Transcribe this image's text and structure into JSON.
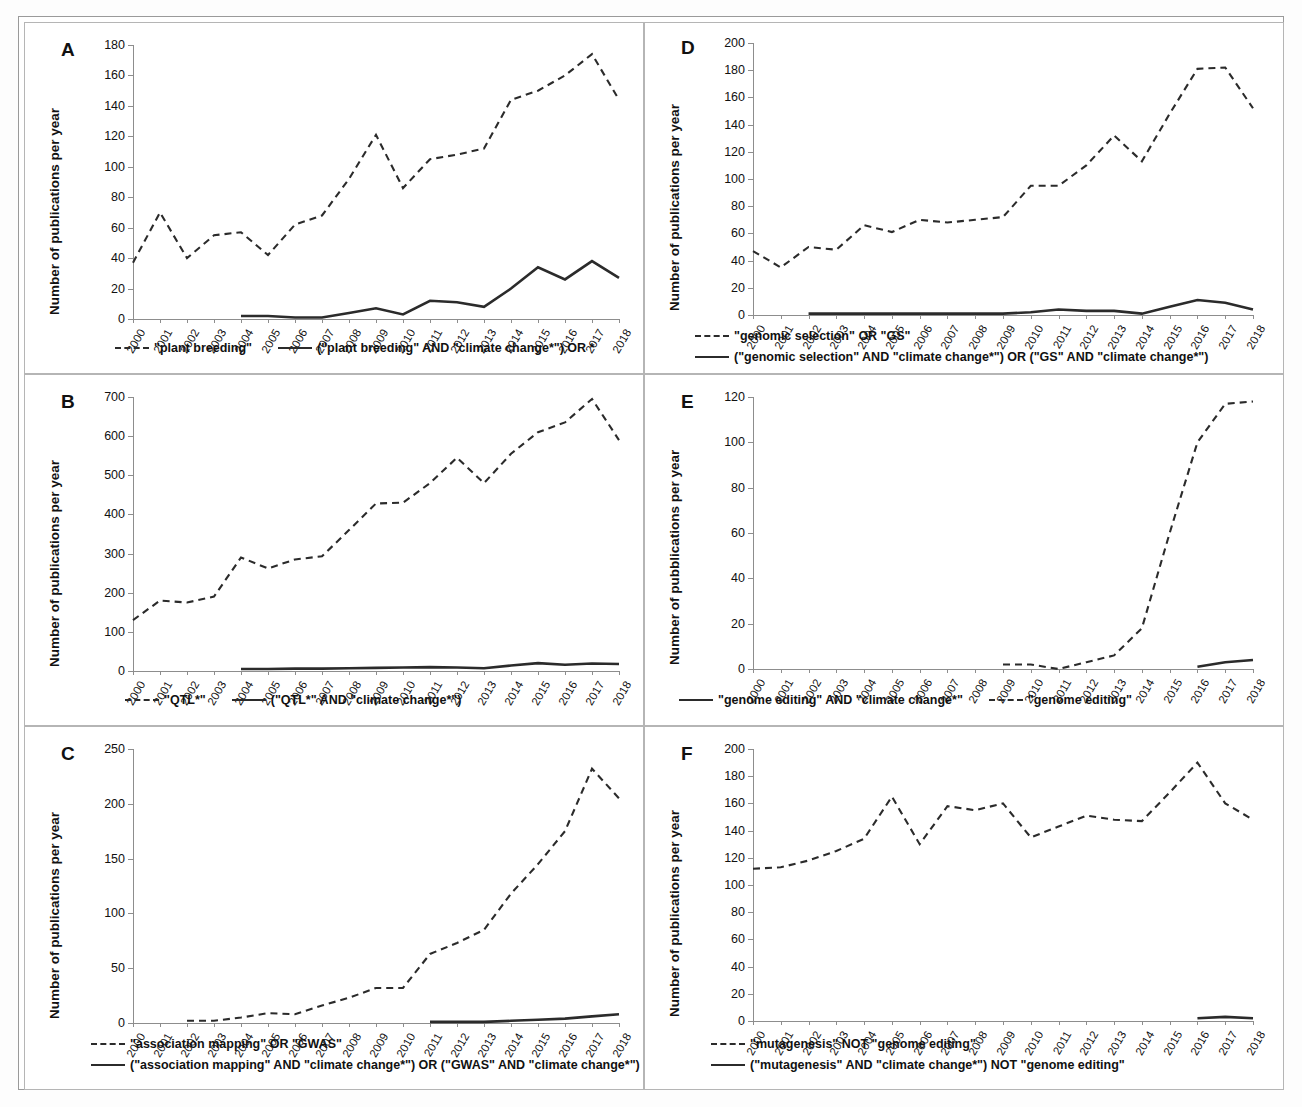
{
  "figure": {
    "ylabel_default": "Number of publications per year",
    "years": [
      2000,
      2001,
      2002,
      2003,
      2004,
      2005,
      2006,
      2007,
      2008,
      2009,
      2010,
      2011,
      2012,
      2013,
      2014,
      2015,
      2016,
      2017,
      2018
    ]
  },
  "panels": [
    {
      "letter": "A",
      "ylabel": "Number of publications per year",
      "chart_data": {
        "type": "line",
        "title": "A",
        "xlabel": "",
        "ylabel": "Number of publications per year",
        "ylim": [
          0,
          180
        ],
        "yticks": [
          0,
          20,
          40,
          60,
          80,
          100,
          120,
          140,
          160,
          180
        ],
        "grid": false,
        "legend_position": "bottom",
        "x": [
          2000,
          2001,
          2002,
          2003,
          2004,
          2005,
          2006,
          2007,
          2008,
          2009,
          2010,
          2011,
          2012,
          2013,
          2014,
          2015,
          2016,
          2017,
          2018
        ],
        "series": [
          {
            "name": "\"plant breeding\"",
            "style": "dashed",
            "x": [
              2000,
              2001,
              2002,
              2003,
              2004,
              2005,
              2006,
              2007,
              2008,
              2009,
              2010,
              2011,
              2012,
              2013,
              2014,
              2015,
              2016,
              2017,
              2018
            ],
            "values": [
              37,
              70,
              40,
              55,
              57,
              42,
              62,
              68,
              92,
              121,
              86,
              105,
              108,
              112,
              144,
              150,
              160,
              174,
              144
            ]
          },
          {
            "name": "(\"plant breeding\" AND \"climate change*\") OR *",
            "style": "solid",
            "x": [
              2004,
              2005,
              2006,
              2007,
              2008,
              2009,
              2010,
              2011,
              2012,
              2013,
              2014,
              2015,
              2016,
              2017,
              2018
            ],
            "values": [
              2,
              2,
              1,
              1,
              4,
              7,
              3,
              12,
              11,
              8,
              20,
              34,
              26,
              38,
              27
            ]
          }
        ]
      }
    },
    {
      "letter": "B",
      "ylabel": "Number of publications per year",
      "chart_data": {
        "type": "line",
        "title": "B",
        "xlabel": "",
        "ylabel": "Number of publications per year",
        "ylim": [
          0,
          700
        ],
        "yticks": [
          0,
          100,
          200,
          300,
          400,
          500,
          600,
          700
        ],
        "grid": false,
        "legend_position": "bottom",
        "x": [
          2000,
          2001,
          2002,
          2003,
          2004,
          2005,
          2006,
          2007,
          2008,
          2009,
          2010,
          2011,
          2012,
          2013,
          2014,
          2015,
          2016,
          2017,
          2018
        ],
        "series": [
          {
            "name": "\"QTL*\"",
            "style": "dashed",
            "x": [
              2000,
              2001,
              2002,
              2003,
              2004,
              2005,
              2006,
              2007,
              2008,
              2009,
              2010,
              2011,
              2012,
              2013,
              2014,
              2015,
              2016,
              2017,
              2018
            ],
            "values": [
              130,
              180,
              175,
              190,
              290,
              262,
              285,
              293,
              360,
              428,
              430,
              480,
              545,
              480,
              555,
              610,
              635,
              695,
              590
            ]
          },
          {
            "name": "(\"QTL*\" AND \"climate change*\")",
            "style": "solid",
            "x": [
              2004,
              2005,
              2006,
              2007,
              2008,
              2009,
              2010,
              2011,
              2012,
              2013,
              2014,
              2015,
              2016,
              2017,
              2018
            ],
            "values": [
              5,
              5,
              6,
              6,
              7,
              8,
              9,
              10,
              9,
              7,
              14,
              20,
              16,
              19,
              18
            ]
          }
        ]
      }
    },
    {
      "letter": "C",
      "ylabel": "Number of publications per year",
      "chart_data": {
        "type": "line",
        "title": "C",
        "xlabel": "",
        "ylabel": "Number of publications per year",
        "ylim": [
          0,
          250
        ],
        "yticks": [
          0,
          50,
          100,
          150,
          200,
          250
        ],
        "grid": false,
        "legend_position": "bottom",
        "x": [
          2000,
          2001,
          2002,
          2003,
          2004,
          2005,
          2006,
          2007,
          2008,
          2009,
          2010,
          2011,
          2012,
          2013,
          2014,
          2015,
          2016,
          2017,
          2018
        ],
        "series": [
          {
            "name": "\"association mapping\" OR \"GWAS\"",
            "style": "dashed",
            "x": [
              2002,
              2003,
              2004,
              2005,
              2006,
              2007,
              2008,
              2009,
              2010,
              2011,
              2012,
              2013,
              2014,
              2015,
              2016,
              2017,
              2018
            ],
            "values": [
              2,
              2,
              5,
              9,
              8,
              16,
              23,
              32,
              32,
              63,
              73,
              85,
              118,
              145,
              175,
              232,
              205
            ]
          },
          {
            "name": "(\"association mapping\" AND \"climate change*\") OR (\"GWAS\" AND \"climate change*\")",
            "style": "solid",
            "x": [
              2011,
              2012,
              2013,
              2014,
              2015,
              2016,
              2017,
              2018
            ],
            "values": [
              1,
              1,
              1,
              2,
              3,
              4,
              6,
              8
            ]
          }
        ]
      }
    },
    {
      "letter": "D",
      "ylabel": "Number of publications per year",
      "chart_data": {
        "type": "line",
        "title": "D",
        "xlabel": "",
        "ylabel": "Number of publications per year",
        "ylim": [
          0,
          200
        ],
        "yticks": [
          0,
          20,
          40,
          60,
          80,
          100,
          120,
          140,
          160,
          180,
          200
        ],
        "grid": false,
        "legend_position": "bottom",
        "x": [
          2000,
          2001,
          2002,
          2003,
          2004,
          2005,
          2006,
          2007,
          2008,
          2009,
          2010,
          2011,
          2012,
          2013,
          2014,
          2015,
          2016,
          2017,
          2018
        ],
        "series": [
          {
            "name": "\"genomic selection\" OR \"GS\"",
            "style": "dashed",
            "x": [
              2000,
              2001,
              2002,
              2003,
              2004,
              2005,
              2006,
              2007,
              2008,
              2009,
              2010,
              2011,
              2012,
              2013,
              2014,
              2015,
              2016,
              2017,
              2018
            ],
            "values": [
              47,
              35,
              50,
              48,
              66,
              61,
              70,
              68,
              70,
              72,
              95,
              95,
              110,
              132,
              113,
              148,
              181,
              182,
              152
            ]
          },
          {
            "name": "(\"genomic selection\" AND \"climate change*\") OR (\"GS\" AND \"climate change*\")",
            "style": "solid",
            "x": [
              2002,
              2003,
              2009,
              2010,
              2011,
              2012,
              2013,
              2014,
              2015,
              2016,
              2017,
              2018
            ],
            "values": [
              1,
              1,
              1,
              2,
              4,
              3,
              3,
              1,
              6,
              11,
              9,
              4
            ]
          }
        ]
      }
    },
    {
      "letter": "E",
      "ylabel": "Number of pubblications per year",
      "chart_data": {
        "type": "line",
        "title": "E",
        "xlabel": "",
        "ylabel": "Number of pubblications per year",
        "ylim": [
          0,
          120
        ],
        "yticks": [
          0,
          20,
          40,
          60,
          80,
          100,
          120
        ],
        "grid": false,
        "legend_position": "bottom",
        "x": [
          2000,
          2001,
          2002,
          2003,
          2004,
          2005,
          2006,
          2007,
          2008,
          2009,
          2010,
          2011,
          2012,
          2013,
          2014,
          2015,
          2016,
          2017,
          2018
        ],
        "series": [
          {
            "name": "\"genome editing\" AND \"climate change*\"",
            "style": "solid",
            "x": [
              2016,
              2017,
              2018
            ],
            "values": [
              1,
              3,
              4
            ]
          },
          {
            "name": "\"genome editing\"",
            "style": "dashed",
            "x": [
              2009,
              2010,
              2011,
              2012,
              2013,
              2014,
              2015,
              2016,
              2017,
              2018
            ],
            "values": [
              2,
              2,
              0,
              3,
              6,
              18,
              60,
              100,
              117,
              118
            ]
          }
        ]
      }
    },
    {
      "letter": "F",
      "ylabel": "Number of publications per year",
      "chart_data": {
        "type": "line",
        "title": "F",
        "xlabel": "",
        "ylabel": "Number of publications per year",
        "ylim": [
          0,
          200
        ],
        "yticks": [
          0,
          20,
          40,
          60,
          80,
          100,
          120,
          140,
          160,
          180,
          200
        ],
        "grid": false,
        "legend_position": "bottom",
        "x": [
          2000,
          2001,
          2002,
          2003,
          2004,
          2005,
          2006,
          2007,
          2008,
          2009,
          2010,
          2011,
          2012,
          2013,
          2014,
          2015,
          2016,
          2017,
          2018
        ],
        "series": [
          {
            "name": "\"mutagenesis\" NOT \"genome editing\"",
            "style": "dashed",
            "x": [
              2000,
              2001,
              2002,
              2003,
              2004,
              2005,
              2006,
              2007,
              2008,
              2009,
              2010,
              2011,
              2012,
              2013,
              2014,
              2015,
              2016,
              2017,
              2018
            ],
            "values": [
              112,
              113,
              118,
              125,
              134,
              165,
              130,
              158,
              155,
              160,
              135,
              143,
              151,
              148,
              147,
              168,
              190,
              160,
              148
            ]
          },
          {
            "name": "(\"mutagenesis\" AND \"climate change*\") NOT \"genome editing\"",
            "style": "solid",
            "x": [
              2016,
              2017,
              2018
            ],
            "values": [
              2,
              3,
              2
            ]
          }
        ]
      }
    }
  ]
}
